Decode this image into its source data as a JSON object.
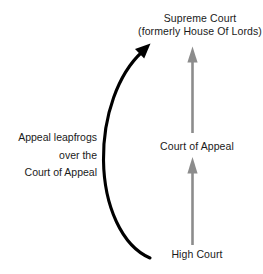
{
  "diagram": {
    "background_color": "#ffffff",
    "text_color": "#1a1a1a",
    "hierarchy_arrow_color": "#8c8c8c",
    "leapfrog_arrow_color": "#000000",
    "nodes": {
      "supreme_court": {
        "line1": "Supreme Court",
        "line2": "(formerly House Of Lords)"
      },
      "court_of_appeal": {
        "label": "Court of Appeal"
      },
      "high_court": {
        "label": "High Court"
      }
    },
    "annotation": {
      "line1": "Appeal leapfrogs",
      "line2": "over the",
      "line3": "Court of Appeal"
    },
    "arrows": {
      "high_to_appeal": "arrow-up-icon",
      "appeal_to_supreme": "arrow-up-icon",
      "leapfrog_curve": "curved-arrow-icon"
    }
  }
}
